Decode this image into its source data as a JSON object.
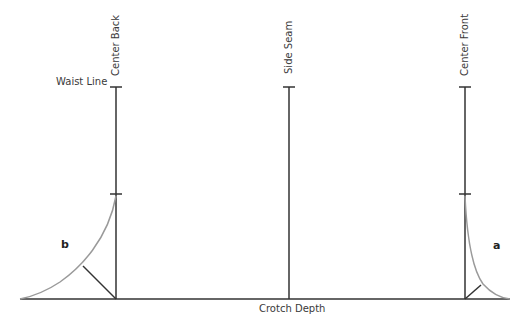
{
  "diagram": {
    "vertical_lines": [
      {
        "label": "Center Back",
        "x": 116
      },
      {
        "label": "Side Seam",
        "x": 289
      },
      {
        "label": "Center Front",
        "x": 465
      }
    ],
    "labels": {
      "waist_line": "Waist Line",
      "center_back": "Center Back",
      "side_seam": "Side Seam",
      "center_front": "Center Front",
      "crotch_depth": "Crotch Depth",
      "point_b": "b",
      "point_a": "a"
    },
    "colors": {
      "line": "#333333",
      "curve": "#9a9a9a",
      "text": "#3a3a3a"
    }
  }
}
